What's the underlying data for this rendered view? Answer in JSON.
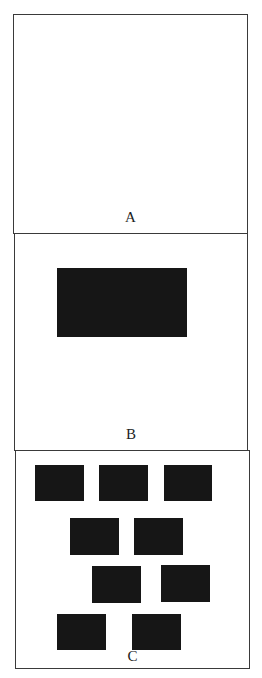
{
  "figure": {
    "panels": [
      {
        "id": "A",
        "label": "A",
        "box": {
          "x": 13,
          "y": 14,
          "w": 235,
          "h": 220
        },
        "label_top": 195,
        "rects": []
      },
      {
        "id": "B",
        "label": "B",
        "box": {
          "x": 14,
          "y": 233,
          "w": 234,
          "h": 218
        },
        "label_top": 193,
        "rects": [
          {
            "x": 42,
            "y": 34,
            "w": 130,
            "h": 69
          }
        ]
      },
      {
        "id": "C",
        "label": "C",
        "box": {
          "x": 15,
          "y": 450,
          "w": 235,
          "h": 219
        },
        "label_top": 198,
        "rects": [
          {
            "x": 19,
            "y": 14,
            "w": 49,
            "h": 36
          },
          {
            "x": 83,
            "y": 14,
            "w": 49,
            "h": 36
          },
          {
            "x": 148,
            "y": 14,
            "w": 48,
            "h": 36
          },
          {
            "x": 54,
            "y": 67,
            "w": 49,
            "h": 37
          },
          {
            "x": 118,
            "y": 67,
            "w": 49,
            "h": 37
          },
          {
            "x": 76,
            "y": 115,
            "w": 49,
            "h": 37
          },
          {
            "x": 145,
            "y": 114,
            "w": 49,
            "h": 37
          },
          {
            "x": 41,
            "y": 163,
            "w": 49,
            "h": 36
          },
          {
            "x": 116,
            "y": 163,
            "w": 49,
            "h": 36
          }
        ]
      }
    ],
    "colors": {
      "border": "#3a3a3a",
      "fill": "#161616",
      "background": "#ffffff"
    }
  }
}
